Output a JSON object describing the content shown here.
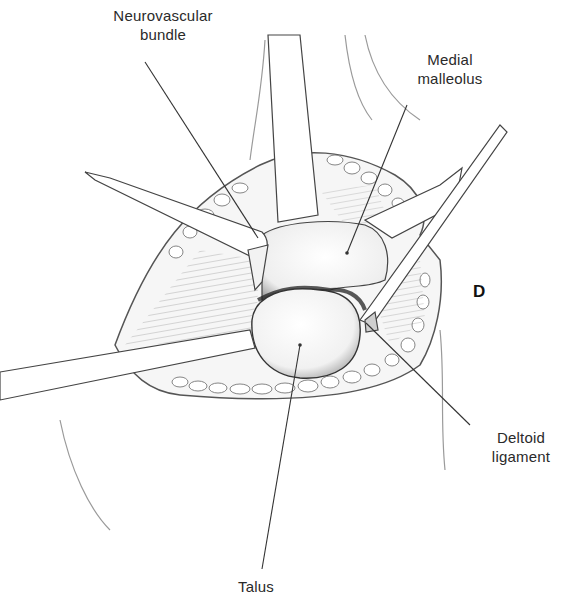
{
  "figure": {
    "panel_letter": "D",
    "labels": {
      "neurovascular_bundle": [
        "Neurovascular",
        "bundle"
      ],
      "medial_malleolus": [
        "Medial",
        "malleolus"
      ],
      "deltoid_ligament": [
        "Deltoid",
        "ligament"
      ],
      "talus": [
        "Talus"
      ]
    }
  }
}
